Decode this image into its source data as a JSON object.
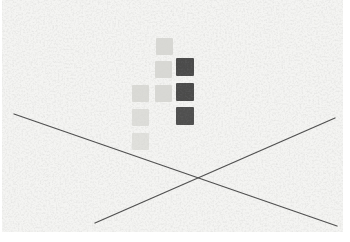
{
  "canvas": {
    "width": 350,
    "height": 242,
    "background": "#ffffff",
    "texture_area": {
      "x": 2,
      "y": 0,
      "w": 341,
      "h": 232
    },
    "texture_base": "#f4f4f2",
    "texture_speckle": "#9a9a96"
  },
  "colors": {
    "light_square": "#d7d7d3",
    "dark_square": "#454545",
    "line": "#4f4f4f"
  },
  "squares": [
    {
      "x": 156,
      "y": 38,
      "size": 17,
      "tone": "light",
      "opacity": 0.95
    },
    {
      "x": 155,
      "y": 61,
      "size": 17,
      "tone": "light",
      "opacity": 0.95
    },
    {
      "x": 132,
      "y": 85,
      "size": 17,
      "tone": "light",
      "opacity": 0.9
    },
    {
      "x": 155,
      "y": 85,
      "size": 17,
      "tone": "light",
      "opacity": 0.95
    },
    {
      "x": 132,
      "y": 109,
      "size": 17,
      "tone": "light",
      "opacity": 0.8
    },
    {
      "x": 132,
      "y": 133,
      "size": 17,
      "tone": "light",
      "opacity": 0.7
    },
    {
      "x": 176,
      "y": 58,
      "size": 18,
      "tone": "dark",
      "opacity": 0.96
    },
    {
      "x": 176,
      "y": 83,
      "size": 18,
      "tone": "dark",
      "opacity": 0.96
    },
    {
      "x": 176,
      "y": 107,
      "size": 18,
      "tone": "dark",
      "opacity": 0.94
    }
  ],
  "lines": [
    {
      "x1": 14,
      "y1": 114,
      "x2": 337,
      "y2": 226,
      "width": 1.3
    },
    {
      "x1": 95,
      "y1": 223,
      "x2": 335,
      "y2": 118,
      "width": 1.3
    }
  ]
}
